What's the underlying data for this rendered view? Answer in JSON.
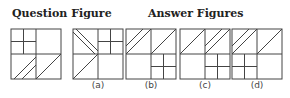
{
  "headings": {
    "question": "Question Figure",
    "answers": "Answer Figures"
  },
  "answer_options": [
    {
      "id": "a",
      "label": "(a)"
    },
    {
      "id": "b",
      "label": "(b)"
    },
    {
      "id": "c",
      "label": "(c)"
    },
    {
      "id": "d",
      "label": "(d)"
    }
  ],
  "colors": {
    "line": "#444444",
    "text": "#222222",
    "background": "#ffffff"
  }
}
